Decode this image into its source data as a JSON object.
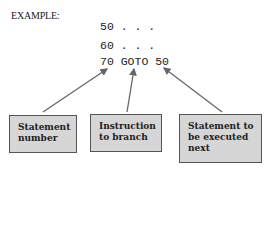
{
  "title": "EXAMPLE:",
  "code_lines": [
    "50 . . .",
    "60 . . .",
    "70 GOTO 50"
  ],
  "labels": [
    {
      "line1": "Statement",
      "line2": "number"
    },
    {
      "line1": "Instruction",
      "line2": "to branch"
    },
    {
      "line1": "Statement to",
      "line2": "be executed",
      "line3": "next"
    }
  ],
  "colors": {
    "box_fill": "#d6d6d6",
    "box_border": "#555555",
    "arrow": "#666666"
  }
}
